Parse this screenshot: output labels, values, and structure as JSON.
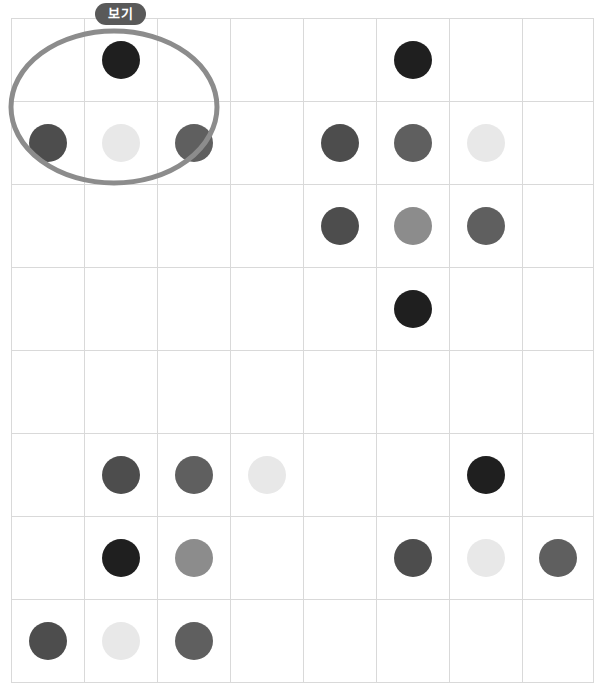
{
  "badge": {
    "label": "보기"
  },
  "palette": {
    "black": "#1f1f1f",
    "dark_gray": "#4d4d4d",
    "medium_dark_gray": "#5f5f5f",
    "medium_gray": "#8c8c8c",
    "light_gray": "#e8e8e8",
    "grid_line": "#d9d9d9",
    "oval_stroke": "#8c8c8c",
    "badge_background": "#595959",
    "badge_text": "#ffffff",
    "page_background": "#ffffff"
  },
  "grid": {
    "columns": 8,
    "rows": 8,
    "cell_width": 72,
    "cell_height": 82,
    "dot_diameter": 38,
    "cells": [
      [
        {
          "dot": false,
          "color": null,
          "shade": null
        },
        {
          "dot": true,
          "color": "#1f1f1f",
          "shade": "black"
        },
        {
          "dot": false,
          "color": null,
          "shade": null
        },
        {
          "dot": false,
          "color": null,
          "shade": null
        },
        {
          "dot": false,
          "color": null,
          "shade": null
        },
        {
          "dot": true,
          "color": "#1f1f1f",
          "shade": "black"
        },
        {
          "dot": false,
          "color": null,
          "shade": null
        },
        {
          "dot": false,
          "color": null,
          "shade": null
        }
      ],
      [
        {
          "dot": true,
          "color": "#4d4d4d",
          "shade": "dark_gray"
        },
        {
          "dot": true,
          "color": "#e8e8e8",
          "shade": "light_gray"
        },
        {
          "dot": true,
          "color": "#5f5f5f",
          "shade": "medium_dark_gray"
        },
        {
          "dot": false,
          "color": null,
          "shade": null
        },
        {
          "dot": true,
          "color": "#4d4d4d",
          "shade": "dark_gray"
        },
        {
          "dot": true,
          "color": "#5f5f5f",
          "shade": "medium_dark_gray"
        },
        {
          "dot": true,
          "color": "#e8e8e8",
          "shade": "light_gray"
        },
        {
          "dot": false,
          "color": null,
          "shade": null
        }
      ],
      [
        {
          "dot": false,
          "color": null,
          "shade": null
        },
        {
          "dot": false,
          "color": null,
          "shade": null
        },
        {
          "dot": false,
          "color": null,
          "shade": null
        },
        {
          "dot": false,
          "color": null,
          "shade": null
        },
        {
          "dot": true,
          "color": "#4d4d4d",
          "shade": "dark_gray"
        },
        {
          "dot": true,
          "color": "#8c8c8c",
          "shade": "medium_gray"
        },
        {
          "dot": true,
          "color": "#5f5f5f",
          "shade": "medium_dark_gray"
        },
        {
          "dot": false,
          "color": null,
          "shade": null
        }
      ],
      [
        {
          "dot": false,
          "color": null,
          "shade": null
        },
        {
          "dot": false,
          "color": null,
          "shade": null
        },
        {
          "dot": false,
          "color": null,
          "shade": null
        },
        {
          "dot": false,
          "color": null,
          "shade": null
        },
        {
          "dot": false,
          "color": null,
          "shade": null
        },
        {
          "dot": true,
          "color": "#1f1f1f",
          "shade": "black"
        },
        {
          "dot": false,
          "color": null,
          "shade": null
        },
        {
          "dot": false,
          "color": null,
          "shade": null
        }
      ],
      [
        {
          "dot": false,
          "color": null,
          "shade": null
        },
        {
          "dot": false,
          "color": null,
          "shade": null
        },
        {
          "dot": false,
          "color": null,
          "shade": null
        },
        {
          "dot": false,
          "color": null,
          "shade": null
        },
        {
          "dot": false,
          "color": null,
          "shade": null
        },
        {
          "dot": false,
          "color": null,
          "shade": null
        },
        {
          "dot": false,
          "color": null,
          "shade": null
        },
        {
          "dot": false,
          "color": null,
          "shade": null
        }
      ],
      [
        {
          "dot": false,
          "color": null,
          "shade": null
        },
        {
          "dot": true,
          "color": "#4d4d4d",
          "shade": "dark_gray"
        },
        {
          "dot": true,
          "color": "#5f5f5f",
          "shade": "medium_dark_gray"
        },
        {
          "dot": true,
          "color": "#e8e8e8",
          "shade": "light_gray"
        },
        {
          "dot": false,
          "color": null,
          "shade": null
        },
        {
          "dot": false,
          "color": null,
          "shade": null
        },
        {
          "dot": true,
          "color": "#1f1f1f",
          "shade": "black"
        },
        {
          "dot": false,
          "color": null,
          "shade": null
        }
      ],
      [
        {
          "dot": false,
          "color": null,
          "shade": null
        },
        {
          "dot": true,
          "color": "#1f1f1f",
          "shade": "black"
        },
        {
          "dot": true,
          "color": "#8c8c8c",
          "shade": "medium_gray"
        },
        {
          "dot": false,
          "color": null,
          "shade": null
        },
        {
          "dot": false,
          "color": null,
          "shade": null
        },
        {
          "dot": true,
          "color": "#4d4d4d",
          "shade": "dark_gray"
        },
        {
          "dot": true,
          "color": "#e8e8e8",
          "shade": "light_gray"
        },
        {
          "dot": true,
          "color": "#5f5f5f",
          "shade": "medium_dark_gray"
        }
      ],
      [
        {
          "dot": true,
          "color": "#4d4d4d",
          "shade": "dark_gray"
        },
        {
          "dot": true,
          "color": "#e8e8e8",
          "shade": "light_gray"
        },
        {
          "dot": true,
          "color": "#5f5f5f",
          "shade": "medium_dark_gray"
        },
        {
          "dot": false,
          "color": null,
          "shade": null
        },
        {
          "dot": false,
          "color": null,
          "shade": null
        },
        {
          "dot": false,
          "color": null,
          "shade": null
        },
        {
          "dot": false,
          "color": null,
          "shade": null
        },
        {
          "dot": false,
          "color": null,
          "shade": null
        }
      ]
    ]
  },
  "highlight": {
    "shape": "oval",
    "stroke_color": "#8c8c8c",
    "stroke_width": 5,
    "covers_rows": [
      1,
      2
    ],
    "covers_columns": [
      1,
      2,
      3
    ],
    "enclosed_dots": [
      {
        "row": 1,
        "column": 2,
        "color": "#1f1f1f"
      },
      {
        "row": 2,
        "column": 1,
        "color": "#4d4d4d"
      },
      {
        "row": 2,
        "column": 2,
        "color": "#e8e8e8"
      },
      {
        "row": 2,
        "column": 3,
        "color": "#5f5f5f"
      }
    ]
  }
}
